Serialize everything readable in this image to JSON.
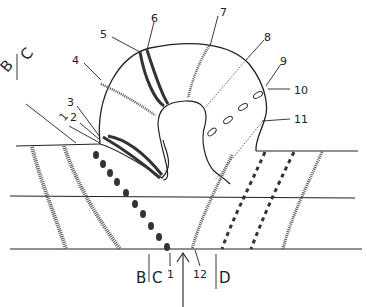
{
  "diagram": {
    "type": "schematic cross-section diagram (line drawing)",
    "colors": {
      "ink": "#222222",
      "stipple": "#555555",
      "background": "#ffffff"
    },
    "region_labels": {
      "top_left_B": "B",
      "top_left_C": "C",
      "bottom_B": "B",
      "bottom_C": "C",
      "bottom_D": "D"
    },
    "numbered_labels": [
      {
        "id": "1",
        "text": "1"
      },
      {
        "id": "2",
        "text": "2"
      },
      {
        "id": "3",
        "text": "3"
      },
      {
        "id": "4",
        "text": "4"
      },
      {
        "id": "5",
        "text": "5"
      },
      {
        "id": "6",
        "text": "6"
      },
      {
        "id": "7",
        "text": "7"
      },
      {
        "id": "8",
        "text": "8"
      },
      {
        "id": "9",
        "text": "9"
      },
      {
        "id": "10",
        "text": "10"
      },
      {
        "id": "11",
        "text": "11"
      },
      {
        "id": "12",
        "text": "12"
      },
      {
        "id": "1b",
        "text": "1"
      }
    ],
    "arrow": {
      "direction": "up"
    },
    "horizontal_layers": 3
  }
}
